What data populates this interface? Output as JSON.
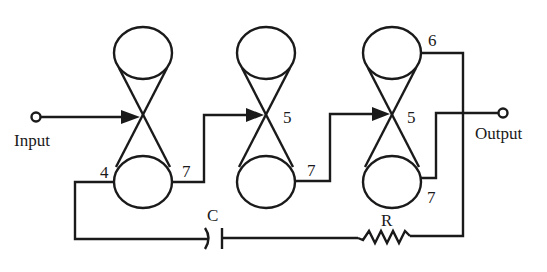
{
  "diagram": {
    "type": "circuit-schematic",
    "labels": {
      "input": "Input",
      "output": "Output",
      "capacitor": "C",
      "resistor": "R"
    },
    "stages": [
      {
        "id": "stage-1",
        "left_pin": "4",
        "right_pin": "7"
      },
      {
        "id": "stage-2",
        "mid_pin": "5",
        "right_pin": "7"
      },
      {
        "id": "stage-3",
        "top_pin": "6",
        "mid_pin": "5",
        "right_pin": "7"
      }
    ],
    "colors": {
      "stroke": "#1a1a1a",
      "background": "#ffffff"
    }
  }
}
